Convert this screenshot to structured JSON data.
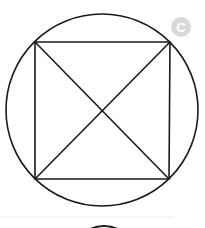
{
  "diagram": {
    "badge": {
      "label": "C",
      "background": "#d9d9d9",
      "text_color": "#ffffff"
    },
    "circle": {
      "cx": 102,
      "cy": 110,
      "r": 96,
      "stroke": "#1a1a1a"
    },
    "square": {
      "corners": {
        "top_left": [
          35,
          42
        ],
        "top_right": [
          170,
          42
        ],
        "bottom_right": [
          169,
          179
        ],
        "bottom_left": [
          35,
          179
        ]
      },
      "stroke": "#1a1a1a"
    },
    "diagonals": [
      {
        "from": "top_left",
        "to": "bottom_right"
      },
      {
        "from": "top_right",
        "to": "bottom_left"
      }
    ],
    "intersection": [
      103,
      110
    ],
    "separator": {
      "y": 217,
      "color": "#e6e6e6"
    },
    "next_figure_arc": {
      "visible": true,
      "stroke": "#1a1a1a"
    }
  }
}
